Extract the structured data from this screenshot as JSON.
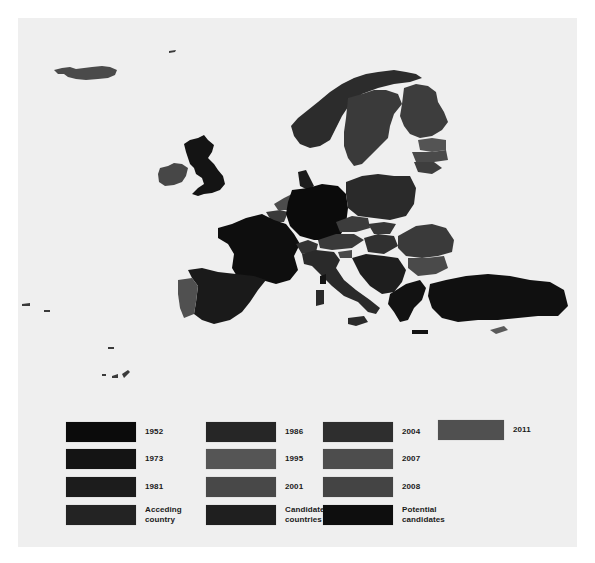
{
  "figure": {
    "type": "map"
  },
  "colors": {
    "background": "#efefef",
    "page": "#ffffff",
    "sea": "#efefef"
  },
  "legend": {
    "items": [
      {
        "label": "1952",
        "color": "#0b0b0b"
      },
      {
        "label": "1973",
        "color": "#141414"
      },
      {
        "label": "1981",
        "color": "#1c1c1c"
      },
      {
        "label": "Acceding\ncountry",
        "color": "#232323"
      },
      {
        "label": "1986",
        "color": "#262626"
      },
      {
        "label": "1995",
        "color": "#555555"
      },
      {
        "label": "2001",
        "color": "#484848"
      },
      {
        "label": "Candidate\ncountries",
        "color": "#1f1f1f"
      },
      {
        "label": "2004",
        "color": "#2e2e2e"
      },
      {
        "label": "2007",
        "color": "#4d4d4d"
      },
      {
        "label": "2008",
        "color": "#444444"
      },
      {
        "label": "Potential\ncandidates",
        "color": "#0e0e0e"
      },
      {
        "label": "2011",
        "color": "#505050"
      }
    ]
  },
  "map": {
    "regions": [
      {
        "name": "Iceland",
        "color": "#4a4a4a"
      },
      {
        "name": "Ireland",
        "color": "#474747"
      },
      {
        "name": "United Kingdom",
        "color": "#141414"
      },
      {
        "name": "Norway",
        "color": "#2c2c2c"
      },
      {
        "name": "Sweden",
        "color": "#3a3a3a"
      },
      {
        "name": "Finland",
        "color": "#3d3d3d"
      },
      {
        "name": "Estonia",
        "color": "#545454"
      },
      {
        "name": "Latvia",
        "color": "#4a4a4a"
      },
      {
        "name": "Lithuania",
        "color": "#3e3e3e"
      },
      {
        "name": "Denmark",
        "color": "#1c1c1c"
      },
      {
        "name": "Netherlands",
        "color": "#4c4c4c"
      },
      {
        "name": "Belgium",
        "color": "#3a3a3a"
      },
      {
        "name": "Germany",
        "color": "#0b0b0b"
      },
      {
        "name": "Poland",
        "color": "#2a2a2a"
      },
      {
        "name": "France",
        "color": "#0e0e0e"
      },
      {
        "name": "Spain",
        "color": "#1a1a1a"
      },
      {
        "name": "Portugal",
        "color": "#505050"
      },
      {
        "name": "Switzerland",
        "color": "#333333"
      },
      {
        "name": "Austria",
        "color": "#3a3a3a"
      },
      {
        "name": "Czechia",
        "color": "#3c3c3c"
      },
      {
        "name": "Slovakia",
        "color": "#363636"
      },
      {
        "name": "Hungary",
        "color": "#303030"
      },
      {
        "name": "Italy",
        "color": "#2a2a2a"
      },
      {
        "name": "Slovenia",
        "color": "#4a4a4a"
      },
      {
        "name": "Balkans",
        "color": "#1e1e1e"
      },
      {
        "name": "Romania",
        "color": "#3a3a3a"
      },
      {
        "name": "Bulgaria",
        "color": "#4a4a4a"
      },
      {
        "name": "Greece",
        "color": "#121212"
      },
      {
        "name": "Turkey",
        "color": "#101010"
      },
      {
        "name": "Cyprus",
        "color": "#5a5a5a"
      }
    ]
  }
}
